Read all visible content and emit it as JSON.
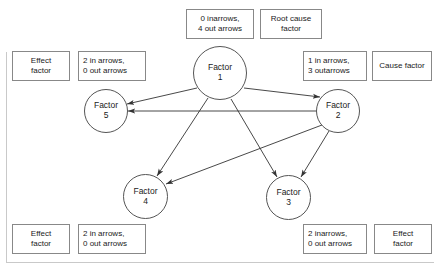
{
  "diagram": {
    "nodes": [
      {
        "id": "factor-1",
        "line1": "Factor",
        "line2": "1"
      },
      {
        "id": "factor-2",
        "line1": "Factor",
        "line2": "2"
      },
      {
        "id": "factor-3",
        "line1": "Factor",
        "line2": "3"
      },
      {
        "id": "factor-4",
        "line1": "Factor",
        "line2": "4"
      },
      {
        "id": "factor-5",
        "line1": "Factor",
        "line2": "5"
      }
    ],
    "edges": [
      {
        "from": "factor-1",
        "to": "factor-5"
      },
      {
        "from": "factor-1",
        "to": "factor-2"
      },
      {
        "from": "factor-1",
        "to": "factor-4"
      },
      {
        "from": "factor-1",
        "to": "factor-3"
      },
      {
        "from": "factor-2",
        "to": "factor-5"
      },
      {
        "from": "factor-2",
        "to": "factor-4"
      },
      {
        "from": "factor-2",
        "to": "factor-3"
      }
    ],
    "annotations": {
      "factor1_counts": {
        "line1": "0 inarrows,",
        "line2": "4 out arrows"
      },
      "factor1_class": {
        "line1": "Root cause",
        "line2": "factor"
      },
      "factor5_class": {
        "line1": "Effect",
        "line2": "factor"
      },
      "factor5_counts": {
        "line1": "2 in arrows,",
        "line2": "0 out arrows"
      },
      "factor2_counts": {
        "line1": "1 in arrows,",
        "line2": "3 outarrows"
      },
      "factor2_class": {
        "line1": "Cause factor",
        "line2": ""
      },
      "factor4_class": {
        "line1": "Effect",
        "line2": "factor"
      },
      "factor4_counts": {
        "line1": "2 in arrows,",
        "line2": "0 out arrows"
      },
      "factor3_counts": {
        "line1": "2 inarrows,",
        "line2": "0 out arrows"
      },
      "factor3_class": {
        "line1": "Effect",
        "line2": "factor"
      }
    },
    "colors": {
      "node_stroke": "#555555",
      "edge_stroke": "#333333",
      "box_stroke": "#888888",
      "text": "#1a1a1a",
      "background": "#ffffff"
    }
  }
}
